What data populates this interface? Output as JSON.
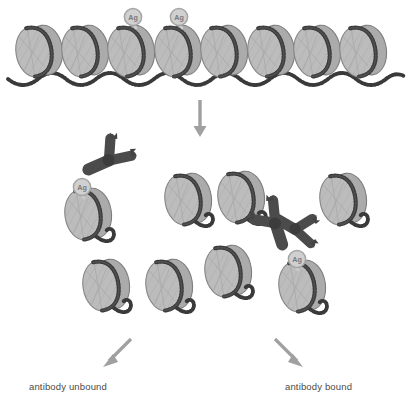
{
  "figure": {
    "background_color": "#ffffff",
    "width": 414,
    "height": 398
  },
  "palette": {
    "nucleosome_face": "#b9b9b9",
    "nucleosome_face_light": "#c9c9c9",
    "nucleosome_side": "#a8a8a8",
    "nucleosome_outline": "#6f6f6f",
    "dna_dark": "#3a3a3a",
    "antibody_dark": "#4b4b4b",
    "antibody_darker": "#3c3c3c",
    "tag_fill": "#d0d0d0",
    "tag_outline": "#9a9a9a",
    "tag_text": "#6b6b6b",
    "arrow_gray": "#a0a0a0",
    "caption_text": "#4a4a4a"
  },
  "rows": {
    "top_row": {
      "name": "chromatin-fiber",
      "nucleosome_count": 8,
      "tagged_indices": [
        2,
        3
      ],
      "description": "continuous nucleosome array connected by beaded linker DNA"
    },
    "middle_row": {
      "name": "fragmented-chromatin",
      "nucleosome_count": 4,
      "free_antibody_count": 2
    },
    "bottom_row": {
      "name": "sorted-chromatin",
      "nucleosome_count": 4
    }
  },
  "tags": [
    {
      "id": "tag-top-1",
      "label": "Ag"
    },
    {
      "id": "tag-top-2",
      "label": "Ag"
    },
    {
      "id": "tag-left-bound",
      "label": "Ag"
    },
    {
      "id": "tag-right-bound",
      "label": "Ag"
    }
  ],
  "arrows": {
    "main_down": {
      "name": "arrow-down-main",
      "direction": "down"
    },
    "split_left": {
      "name": "arrow-down-left",
      "direction": "down-left"
    },
    "split_right": {
      "name": "arrow-down-right",
      "direction": "down-right"
    }
  },
  "captions": {
    "left": "antibody unbound",
    "right": "antibody bound"
  }
}
